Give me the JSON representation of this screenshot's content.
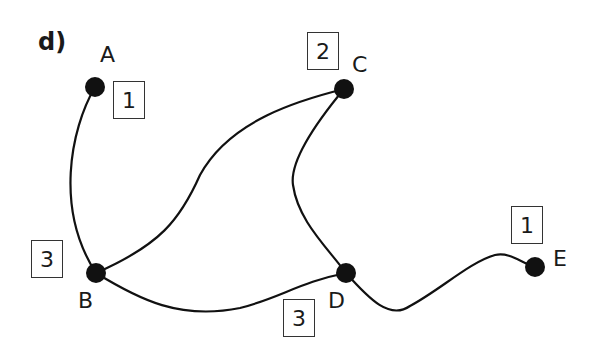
{
  "figure_label": "d)",
  "nodes": [
    {
      "id": "A",
      "label": "A",
      "degree_box": "1",
      "x": 95,
      "y": 87
    },
    {
      "id": "B",
      "label": "B",
      "degree_box": "3",
      "x": 96,
      "y": 273
    },
    {
      "id": "C",
      "label": "C",
      "degree_box": "2",
      "x": 344,
      "y": 89
    },
    {
      "id": "D",
      "label": "D",
      "degree_box": "3",
      "x": 346,
      "y": 273
    },
    {
      "id": "E",
      "label": "E",
      "degree_box": "1",
      "x": 535,
      "y": 267
    }
  ],
  "edges": [
    {
      "from": "A",
      "to": "B"
    },
    {
      "from": "B",
      "to": "C"
    },
    {
      "from": "C",
      "to": "D"
    },
    {
      "from": "B",
      "to": "D"
    },
    {
      "from": "D",
      "to": "E"
    }
  ],
  "colors": {
    "node": "#111111",
    "edge": "#111111",
    "box_border": "#333333"
  }
}
